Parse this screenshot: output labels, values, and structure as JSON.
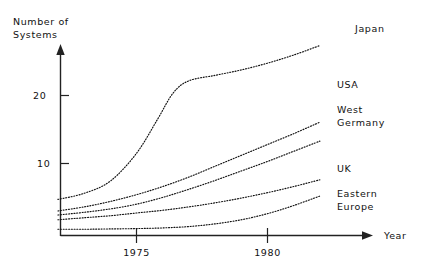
{
  "chart_data": {
    "type": "line",
    "title": "",
    "ylabel": "Number of Systems",
    "ylabel_line1": "Number of",
    "ylabel_line2": "Systems",
    "xlabel": "Year",
    "xlim": [
      1972,
      1983
    ],
    "ylim": [
      0,
      30
    ],
    "grid": false,
    "legend_position": "right-inline-labels",
    "xticks": [
      1975,
      1980
    ],
    "xtick_labels": [
      "1975",
      "1980"
    ],
    "yticks": [
      10,
      20
    ],
    "ytick_labels": [
      "10",
      "20"
    ],
    "line_style": "dotted",
    "series": [
      {
        "name": "Japan",
        "label": "Japan",
        "x": [
          1972,
          1973,
          1974,
          1975,
          1975.8,
          1976.4,
          1977,
          1978,
          1979,
          1980,
          1981,
          1982
        ],
        "values": [
          4.7,
          5.6,
          7.4,
          11.5,
          16.5,
          20.4,
          22.2,
          23.0,
          23.8,
          24.8,
          26.0,
          27.4
        ]
      },
      {
        "name": "USA",
        "label": "USA",
        "x": [
          1972,
          1973,
          1974,
          1975,
          1976,
          1977,
          1978,
          1979,
          1980,
          1981,
          1982
        ],
        "values": [
          3.0,
          3.6,
          4.4,
          5.4,
          6.6,
          8.0,
          9.6,
          11.2,
          12.8,
          14.4,
          16.1
        ]
      },
      {
        "name": "West Germany",
        "label": "West Germany",
        "label_line1": "West",
        "label_line2": "Germany",
        "x": [
          1972,
          1973,
          1974,
          1975,
          1976,
          1977,
          1978,
          1979,
          1980,
          1981,
          1982
        ],
        "values": [
          2.4,
          2.8,
          3.3,
          4.0,
          5.0,
          6.2,
          7.5,
          8.9,
          10.3,
          11.8,
          13.3
        ]
      },
      {
        "name": "UK",
        "label": "UK",
        "x": [
          1972,
          1973,
          1974,
          1975,
          1976,
          1977,
          1978,
          1979,
          1980,
          1981,
          1982
        ],
        "values": [
          1.7,
          2.0,
          2.3,
          2.7,
          3.1,
          3.6,
          4.2,
          4.9,
          5.7,
          6.6,
          7.6
        ]
      },
      {
        "name": "Eastern Europe",
        "label": "Eastern Europe",
        "label_line1": "Eastern",
        "label_line2": "Europe",
        "x": [
          1972,
          1973,
          1974,
          1975,
          1976,
          1977,
          1978,
          1979,
          1980,
          1981,
          1982
        ],
        "values": [
          0.3,
          0.3,
          0.35,
          0.4,
          0.5,
          0.7,
          1.1,
          1.7,
          2.6,
          3.8,
          5.2
        ]
      }
    ],
    "colors": {
      "ink": "#111111",
      "axis": "#222222",
      "background": "#ffffff"
    }
  }
}
